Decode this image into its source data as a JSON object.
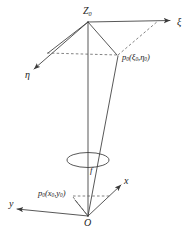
{
  "figure": {
    "type": "optical-imaging-geometry-diagram",
    "background_color": "#ffffff",
    "line_color": "#3a3a3a",
    "text_color": "#1c1c1c"
  },
  "labels": {
    "apex": {
      "base": "Z",
      "sub": "0"
    },
    "axis_xi": {
      "base": "ξ",
      "sub": ""
    },
    "axis_eta": {
      "base": "η",
      "sub": ""
    },
    "axis_x": {
      "base": "x",
      "sub": ""
    },
    "axis_y": {
      "base": "y",
      "sub": ""
    },
    "origin": {
      "base": "O",
      "sub": ""
    },
    "focal": {
      "base": "f",
      "sub": ""
    },
    "object_point": {
      "base": "p",
      "sub": "0",
      "open": "(",
      "arg1": "ξ",
      "arg1_sub": "0",
      "comma": ",",
      "arg2": "η",
      "arg2_sub": "0",
      "close": ")"
    },
    "image_point": {
      "base": "p",
      "sub": "0",
      "open": "(",
      "arg1": "x",
      "arg1_sub": "0",
      "comma": ",",
      "arg2": "y",
      "arg2_sub": "0",
      "close": ")"
    }
  },
  "geometry": {
    "apex_point": [
      88,
      22
    ],
    "xi_arrow_end": [
      175,
      21
    ],
    "eta_arrow_end": [
      30,
      72
    ],
    "object_point": [
      118,
      55
    ],
    "lens_center": [
      88,
      160
    ],
    "origin_point": [
      88,
      216
    ],
    "x_arrow_end": [
      124,
      182
    ],
    "y_arrow_end": [
      12,
      209
    ],
    "image_point": [
      72,
      196
    ]
  }
}
